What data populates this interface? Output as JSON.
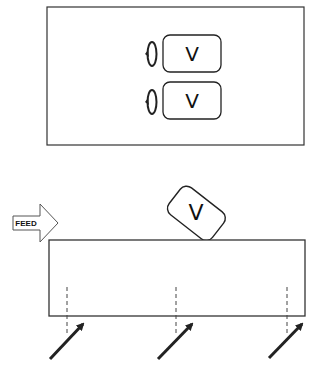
{
  "diagram": {
    "top_panel": {
      "valves": [
        {
          "label": "V",
          "rotation_icon": "rotate-arrow-icon"
        },
        {
          "label": "V",
          "rotation_icon": "rotate-arrow-icon"
        }
      ]
    },
    "bottom_panel": {
      "feed_label": "FEED",
      "tilted_valve_label": "V",
      "arrows_count": 3,
      "arrow_icon": "diagonal-arrow-icon"
    },
    "colors": {
      "stroke": "#222222",
      "background": "#ffffff"
    }
  }
}
